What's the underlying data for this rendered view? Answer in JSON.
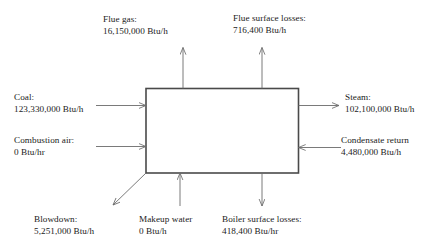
{
  "diagram": {
    "type": "boiler-energy-balance-block-diagram",
    "box": {
      "label": ""
    },
    "colors": {
      "box_stroke": "#4a4a4a",
      "arrow_stroke": "#6b6b6b",
      "text": "#1b1b1b",
      "background": "#ffffff"
    },
    "streams": [
      {
        "id": "flue-gas",
        "name": "Flue gas",
        "title": "Flue gas:",
        "value": "16,150,000 Btu/h",
        "direction": "out",
        "side": "top"
      },
      {
        "id": "flue-surface-losses",
        "name": "Flue surface losses",
        "title": "Flue surface losses:",
        "value": "716,400 Btu/h",
        "direction": "out",
        "side": "top"
      },
      {
        "id": "coal",
        "name": "Coal",
        "title": "Coal:",
        "value": "123,330,000 Btu/h",
        "direction": "in",
        "side": "left"
      },
      {
        "id": "combustion-air",
        "name": "Combustion air",
        "title": "Combustion air:",
        "value": "0 Btu/hr",
        "direction": "in",
        "side": "left"
      },
      {
        "id": "steam",
        "name": "Steam",
        "title": "Steam:",
        "value": "102,100,000 Btu/h",
        "direction": "out",
        "side": "right"
      },
      {
        "id": "condensate-return",
        "name": "Condensate return",
        "title": "Condensate return",
        "value": "4,480,000 Btu/h",
        "direction": "in",
        "side": "right"
      },
      {
        "id": "blowdown",
        "name": "Blowdown",
        "title": "Blowdown:",
        "value": "5,251,000 Btu/h",
        "direction": "out",
        "side": "bottom-left-diagonal"
      },
      {
        "id": "makeup-water",
        "name": "Makeup water",
        "title": "Makeup water",
        "value": "0 Btu/h",
        "direction": "in",
        "side": "bottom"
      },
      {
        "id": "boiler-surface-losses",
        "name": "Boiler surface losses",
        "title": "Boiler surface losses:",
        "value": "418,400 Btu/hr",
        "direction": "out",
        "side": "bottom"
      }
    ]
  }
}
